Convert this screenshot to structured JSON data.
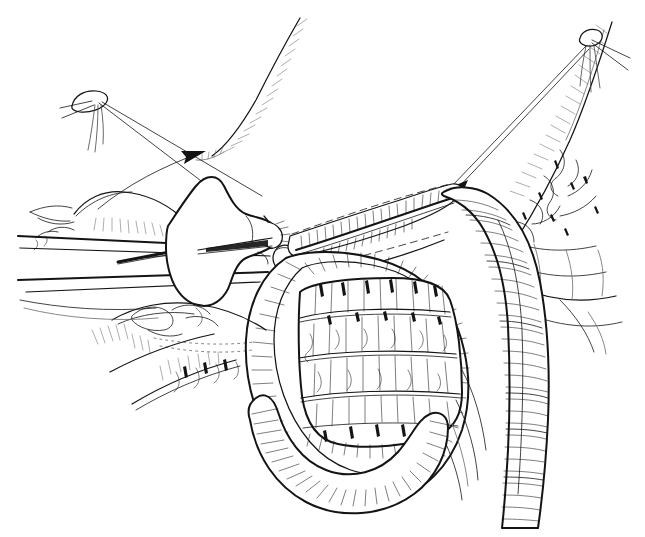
{
  "figure": {
    "medium": "pen-and-ink line drawing",
    "palette": {
      "background": "#ffffff",
      "ink": "#141414",
      "mid_ink": "#444444",
      "light_ink": "#6a6a6a"
    },
    "canvas": {
      "width": 645,
      "height": 537
    },
    "has_text_labels": false,
    "caption": ""
  },
  "structures": {
    "stay_suture_left": {
      "name": "left stay suture knot",
      "knot_center": [
        96,
        100
      ],
      "tail_count": 3
    },
    "stay_suture_right": {
      "name": "right stay suture knot",
      "knot_center": [
        592,
        38
      ],
      "tail_count": 3
    },
    "traction_thread_left": {
      "name": "left traction thread with arrowhead",
      "from": [
        100,
        106
      ],
      "to": [
        206,
        146
      ]
    },
    "traction_thread_right": {
      "name": "right traction thread with arrowhead",
      "from": [
        586,
        46
      ],
      "to": [
        448,
        188
      ]
    },
    "stapler": {
      "name": "linear cutting stapler head and shaft",
      "head_tip": [
        278,
        240
      ],
      "shaft_angle_deg": 14
    },
    "staple_line": {
      "name": "everted staple line along bowel edge",
      "start": [
        286,
        232
      ],
      "end": [
        452,
        190
      ]
    },
    "bowel_loop_anterior": {
      "name": "anterior bowel loop (haustrated, hatched)",
      "lumen_center": [
        370,
        330
      ]
    },
    "bowel_limb_right": {
      "name": "right descending bowel limb",
      "top": [
        500,
        200
      ],
      "bottom": [
        512,
        520
      ]
    },
    "mesentery_right": {
      "name": "right mesenteric fold with vessels"
    },
    "omental_tissue_left": {
      "name": "left fatty / omental tissue"
    }
  }
}
